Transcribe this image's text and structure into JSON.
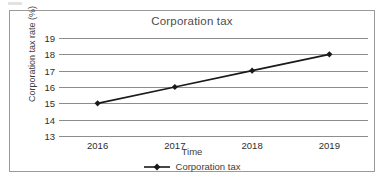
{
  "chart_data": {
    "type": "line",
    "title": "Corporation tax",
    "xlabel": "Time",
    "ylabel": "Corporation tax rate (%)",
    "categories": [
      "2016",
      "2017",
      "2018",
      "2019"
    ],
    "series": [
      {
        "name": "Corporation tax",
        "values": [
          15,
          16,
          17,
          18
        ],
        "color": "#1a1a1a",
        "marker": "diamond"
      }
    ],
    "yticks": [
      19,
      18,
      17,
      16,
      15,
      14,
      13
    ],
    "ylim": [
      13,
      19
    ],
    "grid": true,
    "grid_color": "#8d8d8d",
    "legend_position": "bottom",
    "legend_entries": [
      "Corporation tax"
    ],
    "border_color": "#9a9a9a",
    "background": "#ffffff"
  }
}
